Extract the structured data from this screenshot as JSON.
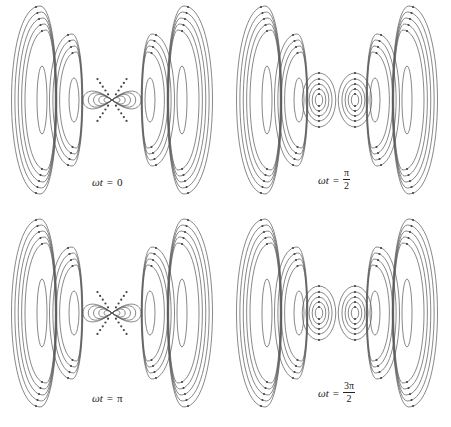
{
  "figure": {
    "panels": [
      {
        "id": "p0",
        "x": 0,
        "y": 0,
        "label": {
          "lhs": "ωt",
          "eq": "=",
          "value": "0",
          "frac": null
        },
        "label_pos": {
          "x": 92,
          "y": 176
        },
        "pinched": true
      },
      {
        "id": "p1",
        "x": 225,
        "y": 0,
        "label": {
          "lhs": "ωt",
          "eq": "=",
          "value": null,
          "frac": {
            "num": "π",
            "den": "2"
          }
        },
        "label_pos": {
          "x": 318,
          "y": 168
        },
        "pinched": false
      },
      {
        "id": "p2",
        "x": 0,
        "y": 213,
        "label": {
          "lhs": "ωt",
          "eq": "=",
          "value": "π",
          "frac": null
        },
        "label_pos": {
          "x": 92,
          "y": 392
        },
        "pinched": true
      },
      {
        "id": "p3",
        "x": 225,
        "y": 213,
        "label": {
          "lhs": "ωt",
          "eq": "=",
          "value": null,
          "frac": {
            "num": "3π",
            "den": "2"
          }
        },
        "label_pos": {
          "x": 318,
          "y": 381
        },
        "pinched": false
      }
    ]
  }
}
